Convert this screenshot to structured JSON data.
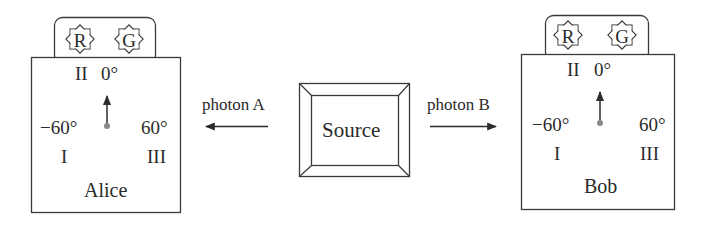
{
  "diagram": {
    "source": {
      "label": "Source"
    },
    "photons": {
      "a": {
        "label": "photon A",
        "direction": "left"
      },
      "b": {
        "label": "photon B",
        "direction": "right"
      }
    },
    "detectors": [
      {
        "name": "Alice",
        "lamps": [
          {
            "letter": "R",
            "meaning": "red"
          },
          {
            "letter": "G",
            "meaning": "green"
          }
        ],
        "dial": {
          "pointer_setting": "II",
          "settings": [
            {
              "roman": "I",
              "angle": "−60°"
            },
            {
              "roman": "II",
              "angle": "0°"
            },
            {
              "roman": "III",
              "angle": "60°"
            }
          ]
        }
      },
      {
        "name": "Bob",
        "lamps": [
          {
            "letter": "R",
            "meaning": "red"
          },
          {
            "letter": "G",
            "meaning": "green"
          }
        ],
        "dial": {
          "pointer_setting": "II",
          "settings": [
            {
              "roman": "I",
              "angle": "−60°"
            },
            {
              "roman": "II",
              "angle": "0°"
            },
            {
              "roman": "III",
              "angle": "60°"
            }
          ]
        }
      }
    ]
  },
  "colors": {
    "stroke": "#3a3a3a",
    "text": "#2b2b2b",
    "dial_pivot": "#8a8a8a",
    "background": "#ffffff"
  }
}
